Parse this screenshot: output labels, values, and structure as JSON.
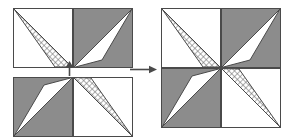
{
  "figure": {
    "kind": "geometric-tiling-diagram",
    "colors": {
      "gray_fill": "#8c8c8c",
      "white_fill": "#ffffff",
      "outline": "#4a4a4a",
      "hatch_line": "#6e6e6e",
      "arrow": "#4a4a4a",
      "background": "#ffffff"
    },
    "cell_size": 59,
    "hatch": {
      "type": "crosshatch",
      "spacing": 4,
      "angle_deg": 45
    }
  },
  "tiles": {
    "top_rect": {
      "name": "top-rectangle",
      "x": 13,
      "y": 8,
      "cols": 2,
      "rows": 1,
      "cells": [
        {
          "name": "top-rect-cell-left",
          "bg": "white",
          "triangle_fill": "hatch",
          "points": "0,0 59,59 42,59"
        },
        {
          "name": "top-rect-cell-right",
          "bg": "gray",
          "triangle_fill": "white",
          "points": "59,0 0,59 29,52"
        }
      ]
    },
    "bottom_rect": {
      "name": "bottom-rectangle",
      "x": 13,
      "y": 77,
      "cols": 2,
      "rows": 1,
      "cells": [
        {
          "name": "bottom-rect-cell-left",
          "bg": "gray",
          "triangle_fill": "white",
          "points": "59,0 0,59 30,7"
        },
        {
          "name": "bottom-rect-cell-right",
          "bg": "white",
          "triangle_fill": "hatch",
          "points": "0,0 59,59 17,0"
        }
      ]
    },
    "result_square": {
      "name": "result-square",
      "x": 161,
      "y": 8,
      "cols": 2,
      "rows": 2,
      "cells": [
        {
          "name": "result-cell-top-left",
          "bg": "white",
          "triangle_fill": "hatch",
          "points": "0,0 59,59 42,59"
        },
        {
          "name": "result-cell-top-right",
          "bg": "gray",
          "triangle_fill": "white",
          "points": "59,0 0,59 29,52"
        },
        {
          "name": "result-cell-bottom-left",
          "bg": "gray",
          "triangle_fill": "white",
          "points": "59,0 0,59 30,7"
        },
        {
          "name": "result-cell-bottom-right",
          "bg": "white",
          "triangle_fill": "hatch",
          "points": "0,0 59,59 17,0"
        }
      ]
    }
  },
  "arrows": {
    "up": {
      "name": "arrow-up",
      "direction": "up",
      "x": 65,
      "y": 62,
      "width": 9,
      "height": 13
    },
    "right": {
      "name": "arrow-right",
      "direction": "right",
      "x": 131,
      "y": 62,
      "width": 27,
      "height": 9
    }
  }
}
